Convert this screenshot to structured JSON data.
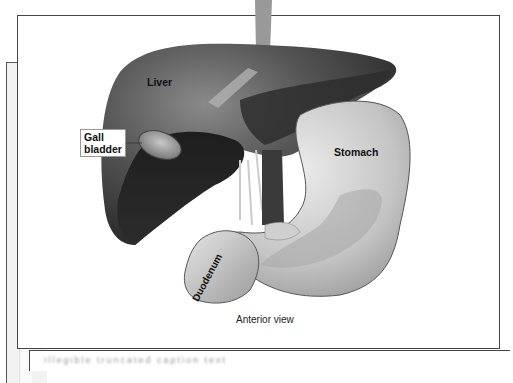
{
  "figure": {
    "labels": {
      "liver": "Liver",
      "gallbladder_line1": "Gall",
      "gallbladder_line2": "bladder",
      "stomach": "Stomach",
      "duodenum": "Duodenum"
    },
    "view_caption": "Anterior view"
  },
  "lower_panel": {
    "caption_text": "Illegible truncated caption text"
  },
  "colors": {
    "frame": "#444444",
    "liver_dark": "#2a2a2a",
    "liver_mid": "#5a5a5a",
    "stomach_light": "#d8d8d8",
    "stomach_mid": "#b5b5b5"
  }
}
